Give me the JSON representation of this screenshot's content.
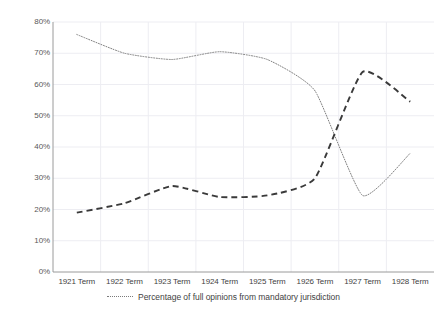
{
  "chart_data": {
    "type": "line",
    "title": "",
    "xlabel": "",
    "ylabel": "",
    "categories": [
      "1921 Term",
      "1922 Term",
      "1923 Term",
      "1924 Term",
      "1925 Term",
      "1926 Term",
      "1927 Term",
      "1928 Term"
    ],
    "ylim": [
      0,
      80
    ],
    "ytick_labels": [
      "0%",
      "10%",
      "20%",
      "30%",
      "40%",
      "50%",
      "60%",
      "70%",
      "80%"
    ],
    "ytick_values": [
      0,
      10,
      20,
      30,
      40,
      50,
      60,
      70,
      80
    ],
    "grid": true,
    "legend_position": "bottom",
    "series": [
      {
        "name": "Percentage of full opinions from mandatory jurisdiction",
        "style": "dotted",
        "color": "#808080",
        "values": [
          76,
          70,
          68,
          70.5,
          68,
          58,
          24.5,
          38
        ]
      },
      {
        "name": "",
        "style": "dashed",
        "color": "#3a3a3a",
        "values": [
          19,
          22,
          27.5,
          24,
          24.5,
          30,
          64,
          54.5
        ]
      }
    ]
  },
  "legend": {
    "items": [
      {
        "label": "Percentage of full opinions from mandatory jurisdiction",
        "marker": "dotted-line-marker"
      }
    ]
  },
  "axes": {
    "y_axis_color": "#9a9a9a",
    "x_axis_color": "#9a9a9a",
    "grid_color": "#ededf2"
  }
}
